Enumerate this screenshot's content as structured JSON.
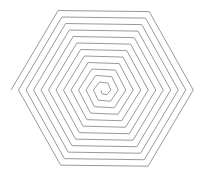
{
  "figure": {
    "type": "hexagonal-spiral",
    "background": "#ffffff",
    "stroke_color": "#9a9a9a",
    "stroke_width": 1,
    "center": [
      104,
      90
    ],
    "sides": 6,
    "orientation": "flat-top",
    "start_radius": 3,
    "end_radius": 93,
    "turns": 12,
    "direction": "counterclockwise-outward"
  }
}
